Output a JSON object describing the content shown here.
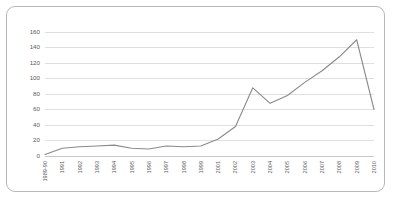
{
  "chart_data": {
    "type": "line",
    "title": "",
    "subtitle": "",
    "xlabel": "",
    "ylabel": "",
    "ylim": [
      0,
      160
    ],
    "ytick_step": 20,
    "yticks": [
      0,
      20,
      40,
      60,
      80,
      100,
      120,
      140,
      160
    ],
    "grid": true,
    "legend": false,
    "legend_position": "none",
    "line_color": "#8a8a8a",
    "gridline_color": "#c9c9c9",
    "border_color": "#b8b8b8",
    "background_color": "#ffffff",
    "tick_label_color": "#5a5a5a",
    "categories": [
      "1989-90",
      "1991",
      "1992",
      "1993",
      "1994",
      "1995",
      "1996",
      "1997",
      "1998",
      "1999",
      "2001",
      "2002",
      "2003",
      "2004",
      "2005",
      "2006",
      "2007",
      "2008",
      "2009",
      "2010"
    ],
    "values": [
      2,
      10,
      12,
      13,
      14,
      10,
      9,
      13,
      12,
      13,
      22,
      38,
      88,
      68,
      78,
      95,
      110,
      128,
      150,
      60
    ]
  }
}
